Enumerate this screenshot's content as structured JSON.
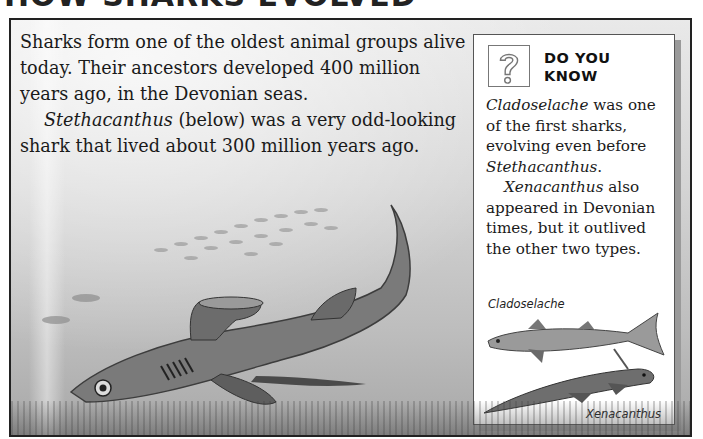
{
  "heading": {
    "text": "HOW SHARKS EVOLVED",
    "note": "cropped at top edge"
  },
  "main_text": {
    "paragraph_1": "Sharks form one of the oldest animal groups alive today. Their ancestors developed 400 million years ago, in the Devonian seas.",
    "paragraph_2_italic": "Stethacanthus",
    "paragraph_2_rest": " (below) was a very odd-looking shark that lived about 300 million years ago."
  },
  "fact_box": {
    "icon": "question-mark-icon",
    "title_line_1": "DO YOU",
    "title_line_2": "KNOW",
    "p1_italic_1": "Cladoselache",
    "p1_text_1": " was one of the first sharks, evolving even before ",
    "p1_italic_2": "Stethacanthus",
    "p1_text_2": ".",
    "p2_italic": "Xenacanthus",
    "p2_text": " also appeared in Devonian times, but it outlived the other two types.",
    "figure_labels": {
      "top": "Cladoselache",
      "bottom": "Xenacanthus"
    }
  },
  "illustration": {
    "subject": "Stethacanthus shark swimming with school of small fish",
    "palette": {
      "water_light": "#e9e9e9",
      "water_dark": "#a8a8a8",
      "shark": "#7a7a7a",
      "frame": "#222222"
    }
  }
}
